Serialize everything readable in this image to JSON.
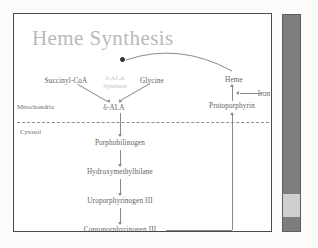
{
  "slide": {
    "title": "Heme Synthesis",
    "compartments": {
      "upper": "Mitochondria",
      "lower": "Cytosol"
    },
    "enzyme": {
      "line1": "δ-ALA",
      "line2": "Synthase"
    },
    "nodes": {
      "succinyl_coa": "Succinyl-CoA",
      "glycine": "Glycine",
      "dala_mito": "δ-ALA",
      "heme": "Heme",
      "iron": "Iron",
      "protoporphyrin": "Protoporphyrin",
      "porphobilinogen": "Porphobilinogen",
      "hydroxymethylbilane": "Hydroxymethylbilane",
      "uroporphyrinogen": "Uroporphyrinogen III",
      "coproporphyrinogen": "Coproporphyrinogen III"
    },
    "colors": {
      "title": "#b9b9b9",
      "node_text": "#5e5e5e",
      "enzyme_text": "#c2c2c2",
      "line": "#8a8a8a",
      "frame": "#4a4a4a",
      "scrollbar": "#7d7d7d",
      "scroll_thumb": "#cfcfcf"
    }
  }
}
